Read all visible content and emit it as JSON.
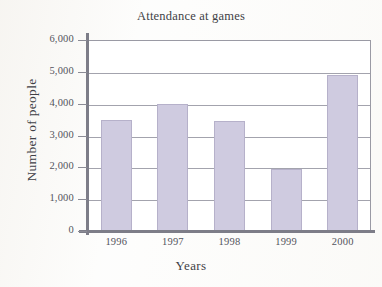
{
  "chart_data": {
    "type": "bar",
    "title": "Attendance at games",
    "xlabel": "Years",
    "ylabel": "Number of people",
    "categories": [
      "1996",
      "1997",
      "1998",
      "1999",
      "2000"
    ],
    "values": [
      3500,
      4000,
      3450,
      1950,
      4900
    ],
    "ylim": [
      0,
      6000
    ],
    "ytick_values": [
      0,
      1000,
      2000,
      3000,
      4000,
      5000,
      6000
    ],
    "ytick_labels": [
      "0",
      "1,000",
      "2,000",
      "3,000",
      "4,000",
      "5,000",
      "6,000"
    ],
    "grid": true,
    "legend": false,
    "bar_color": "#cfcbe0",
    "bar_border_color": "#b6b1ca",
    "gridline_color": "#a3a3ad",
    "axis_color": "#7d7d88",
    "text_color": "#3f3f46",
    "background_color": "#fdfdfc"
  }
}
